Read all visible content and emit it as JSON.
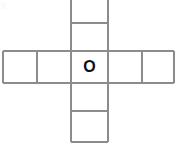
{
  "figure": {
    "type": "cross-grid",
    "background_color": "#ffffff",
    "line_color": "#8c8c8c",
    "label_color": "#111111",
    "canvas": {
      "width": 177,
      "height": 145
    },
    "center_label": "O",
    "grid": {
      "x_lines": [
        3,
        37,
        71,
        108,
        142,
        174
      ],
      "y_lines": [
        0,
        23,
        51,
        83,
        111,
        142
      ]
    },
    "cells": [
      {
        "name": "cell-top-outer",
        "x": 71,
        "y": 0,
        "w": 37,
        "h": 23,
        "label": ""
      },
      {
        "name": "cell-top-inner",
        "x": 71,
        "y": 23,
        "w": 37,
        "h": 28,
        "label": ""
      },
      {
        "name": "cell-left-outer",
        "x": 3,
        "y": 51,
        "w": 34,
        "h": 32,
        "label": ""
      },
      {
        "name": "cell-left-inner",
        "x": 37,
        "y": 51,
        "w": 34,
        "h": 32,
        "label": ""
      },
      {
        "name": "cell-center",
        "x": 71,
        "y": 51,
        "w": 37,
        "h": 32,
        "label": "O"
      },
      {
        "name": "cell-right-inner",
        "x": 108,
        "y": 51,
        "w": 34,
        "h": 32,
        "label": ""
      },
      {
        "name": "cell-right-outer",
        "x": 142,
        "y": 51,
        "w": 32,
        "h": 32,
        "label": ""
      },
      {
        "name": "cell-bottom-inner",
        "x": 71,
        "y": 83,
        "w": 37,
        "h": 28,
        "label": ""
      },
      {
        "name": "cell-bottom-outer",
        "x": 71,
        "y": 111,
        "w": 37,
        "h": 31,
        "label": ""
      }
    ],
    "segments": [
      {
        "name": "v-left-edge",
        "x1": 3,
        "y1": 51,
        "x2": 3,
        "y2": 83
      },
      {
        "name": "v-left-divider",
        "x1": 37,
        "y1": 51,
        "x2": 37,
        "y2": 83
      },
      {
        "name": "v-center-left",
        "x1": 71,
        "y1": 0,
        "x2": 71,
        "y2": 142
      },
      {
        "name": "v-center-right",
        "x1": 108,
        "y1": 0,
        "x2": 108,
        "y2": 142
      },
      {
        "name": "v-right-divider",
        "x1": 142,
        "y1": 51,
        "x2": 142,
        "y2": 83
      },
      {
        "name": "v-right-edge",
        "x1": 174,
        "y1": 51,
        "x2": 174,
        "y2": 83
      },
      {
        "name": "h-top-divider",
        "x1": 71,
        "y1": 23,
        "x2": 108,
        "y2": 23
      },
      {
        "name": "h-middle-top",
        "x1": 3,
        "y1": 51,
        "x2": 174,
        "y2": 51
      },
      {
        "name": "h-middle-bottom",
        "x1": 3,
        "y1": 83,
        "x2": 174,
        "y2": 83
      },
      {
        "name": "h-bottom-divider",
        "x1": 71,
        "y1": 111,
        "x2": 108,
        "y2": 111
      },
      {
        "name": "h-bottom-edge",
        "x1": 71,
        "y1": 142,
        "x2": 108,
        "y2": 142
      }
    ]
  }
}
